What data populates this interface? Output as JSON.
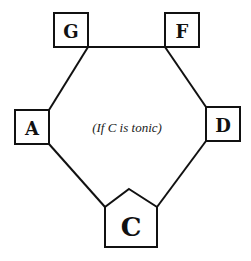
{
  "diagram": {
    "caption": "(If C is tonic)",
    "stroke_color": "#111111",
    "background": "#ffffff",
    "nodes": [
      {
        "id": "G",
        "label": "G",
        "shape": "square"
      },
      {
        "id": "F",
        "label": "F",
        "shape": "square"
      },
      {
        "id": "A",
        "label": "A",
        "shape": "square"
      },
      {
        "id": "D",
        "label": "D",
        "shape": "square"
      },
      {
        "id": "C",
        "label": "C",
        "shape": "pentagon",
        "note": "tonic"
      }
    ],
    "edges": [
      {
        "from": "G",
        "to": "F"
      },
      {
        "from": "G",
        "to": "A"
      },
      {
        "from": "A",
        "to": "C"
      },
      {
        "from": "F",
        "to": "D"
      },
      {
        "from": "D",
        "to": "C"
      }
    ]
  }
}
